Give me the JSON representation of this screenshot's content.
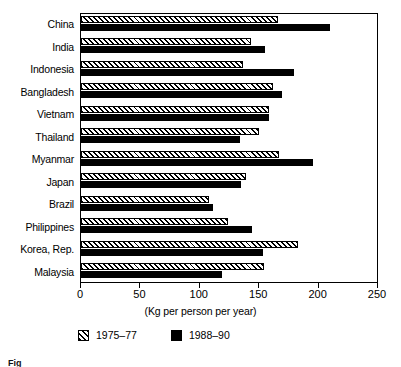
{
  "chart_data": {
    "type": "bar",
    "orientation": "horizontal",
    "title": "",
    "xlabel": "(Kg per person per year)",
    "ylabel": "",
    "xlim": [
      0,
      250
    ],
    "xticks": [
      0,
      50,
      100,
      150,
      200,
      250
    ],
    "grid": false,
    "legend_position": "bottom-left",
    "categories": [
      "China",
      "India",
      "Indonesia",
      "Bangladesh",
      "Vietnam",
      "Thailand",
      "Myanmar",
      "Japan",
      "Brazil",
      "Philippines",
      "Korea, Rep.",
      "Malaysia"
    ],
    "series": [
      {
        "name": "1975–77",
        "pattern": "hatched",
        "values": [
          166,
          143,
          136,
          162,
          158,
          150,
          167,
          139,
          108,
          124,
          183,
          154
        ]
      },
      {
        "name": "1988–90",
        "pattern": "solid",
        "values": [
          210,
          155,
          179,
          169,
          158,
          134,
          195,
          135,
          111,
          144,
          153,
          119
        ]
      }
    ]
  },
  "axis": {
    "tick_labels": [
      "0",
      "50",
      "100",
      "150",
      "200",
      "250"
    ],
    "title": "(Kg per person per year)"
  },
  "legend": {
    "items": [
      {
        "label": "1975–77",
        "pattern": "hatched"
      },
      {
        "label": "1988–90",
        "pattern": "solid"
      }
    ]
  },
  "caption": {
    "text": "Fig"
  },
  "colors": {
    "foreground": "#000000",
    "background": "#ffffff"
  }
}
